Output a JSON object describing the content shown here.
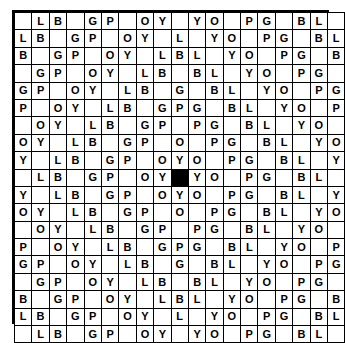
{
  "diagram": {
    "type": "letter-grid",
    "rows": 19,
    "cols": 19,
    "letters_used": [
      "L",
      "B",
      "G",
      "P",
      "O",
      "Y"
    ],
    "blank_symbol": "",
    "filled_cell": {
      "row": 10,
      "col": 10,
      "color": "#000000"
    },
    "border_color": "#000000",
    "cell_background": "#ffffff",
    "text_color": "#000000",
    "grid": [
      [
        "",
        "L",
        "B",
        "",
        "G",
        "P",
        "",
        "O",
        "Y",
        "",
        "Y",
        "O",
        "",
        "P",
        "G",
        "",
        "B",
        "L",
        ""
      ],
      [
        "L",
        "B",
        "",
        "G",
        "P",
        "",
        "O",
        "Y",
        "",
        "L",
        "",
        "Y",
        "O",
        "",
        "P",
        "G",
        "",
        "B",
        "L"
      ],
      [
        "B",
        "",
        "G",
        "P",
        "",
        "O",
        "Y",
        "",
        "L",
        "B",
        "L",
        "",
        "Y",
        "O",
        "",
        "P",
        "G",
        "",
        "B"
      ],
      [
        "",
        "G",
        "P",
        "",
        "O",
        "Y",
        "",
        "L",
        "B",
        "",
        "B",
        "L",
        "",
        "Y",
        "O",
        "",
        "P",
        "G",
        ""
      ],
      [
        "G",
        "P",
        "",
        "O",
        "Y",
        "",
        "L",
        "B",
        "",
        "G",
        "",
        "B",
        "L",
        "",
        "Y",
        "O",
        "",
        "P",
        "G"
      ],
      [
        "P",
        "",
        "O",
        "Y",
        "",
        "L",
        "B",
        "",
        "G",
        "P",
        "G",
        "",
        "B",
        "L",
        "",
        "Y",
        "O",
        "",
        "P"
      ],
      [
        "",
        "O",
        "Y",
        "",
        "L",
        "B",
        "",
        "G",
        "P",
        "",
        "P",
        "G",
        "",
        "B",
        "L",
        "",
        "Y",
        "O",
        ""
      ],
      [
        "O",
        "Y",
        "",
        "L",
        "B",
        "",
        "G",
        "P",
        "",
        "O",
        "",
        "P",
        "G",
        "",
        "B",
        "L",
        "",
        "Y",
        "O"
      ],
      [
        "Y",
        "",
        "L",
        "B",
        "",
        "G",
        "P",
        "",
        "O",
        "Y",
        "O",
        "",
        "P",
        "G",
        "",
        "B",
        "L",
        "",
        "Y"
      ],
      [
        "",
        "L",
        "B",
        "",
        "G",
        "P",
        "",
        "O",
        "Y",
        "#",
        "Y",
        "O",
        "",
        "P",
        "G",
        "",
        "B",
        "L",
        ""
      ],
      [
        "Y",
        "",
        "L",
        "B",
        "",
        "G",
        "P",
        "",
        "O",
        "Y",
        "O",
        "",
        "P",
        "G",
        "",
        "B",
        "L",
        "",
        "Y"
      ],
      [
        "O",
        "Y",
        "",
        "L",
        "B",
        "",
        "G",
        "P",
        "",
        "O",
        "",
        "P",
        "G",
        "",
        "B",
        "L",
        "",
        "Y",
        "O"
      ],
      [
        "",
        "O",
        "Y",
        "",
        "L",
        "B",
        "",
        "G",
        "P",
        "",
        "P",
        "G",
        "",
        "B",
        "L",
        "",
        "Y",
        "O",
        ""
      ],
      [
        "P",
        "",
        "O",
        "Y",
        "",
        "L",
        "B",
        "",
        "G",
        "P",
        "G",
        "",
        "B",
        "L",
        "",
        "Y",
        "O",
        "",
        "P"
      ],
      [
        "G",
        "P",
        "",
        "O",
        "Y",
        "",
        "L",
        "B",
        "",
        "G",
        "",
        "B",
        "L",
        "",
        "Y",
        "O",
        "",
        "P",
        "G"
      ],
      [
        "",
        "G",
        "P",
        "",
        "O",
        "Y",
        "",
        "L",
        "B",
        "",
        "B",
        "L",
        "",
        "Y",
        "O",
        "",
        "P",
        "G",
        ""
      ],
      [
        "B",
        "",
        "G",
        "P",
        "",
        "O",
        "Y",
        "",
        "L",
        "B",
        "L",
        "",
        "Y",
        "O",
        "",
        "P",
        "G",
        "",
        "B"
      ],
      [
        "L",
        "B",
        "",
        "G",
        "P",
        "",
        "O",
        "Y",
        "",
        "L",
        "",
        "Y",
        "O",
        "",
        "P",
        "G",
        "",
        "B",
        "L"
      ],
      [
        "",
        "L",
        "B",
        "",
        "G",
        "P",
        "",
        "O",
        "Y",
        "",
        "Y",
        "O",
        "",
        "P",
        "G",
        "",
        "B",
        "L",
        ""
      ]
    ]
  }
}
